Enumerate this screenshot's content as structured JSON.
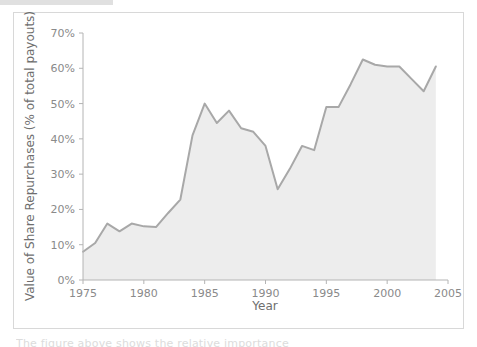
{
  "figure": {
    "background_color": "#ffffff",
    "frame_color": "#d8d8d8",
    "artifact_bar_color": "#e0e0e0",
    "bottom_caption_text": "The figure above shows the relative importance"
  },
  "chart_data": {
    "type": "area",
    "title": "",
    "xlabel": "Year",
    "ylabel": "Value of Share Repurchases (% of total payouts)",
    "xlim": [
      1975,
      2005
    ],
    "ylim": [
      0,
      70
    ],
    "xticks": [
      1975,
      1980,
      1985,
      1990,
      1995,
      2000,
      2005
    ],
    "xtick_labels": [
      "1975",
      "1980",
      "1985",
      "1990",
      "1995",
      "2000",
      "2005"
    ],
    "yticks": [
      0,
      10,
      20,
      30,
      40,
      50,
      60,
      70
    ],
    "ytick_labels": [
      "0%",
      "10%",
      "20%",
      "30%",
      "40%",
      "50%",
      "60%",
      "70%"
    ],
    "grid": false,
    "legend": null,
    "line_color": "#a8a8a8",
    "fill_color": "#ededed",
    "x": [
      1975,
      1976,
      1977,
      1978,
      1979,
      1980,
      1981,
      1982,
      1983,
      1984,
      1985,
      1986,
      1987,
      1988,
      1989,
      1990,
      1991,
      1992,
      1993,
      1994,
      1995,
      1996,
      1997,
      1998,
      1999,
      2000,
      2001,
      2002,
      2003,
      2004
    ],
    "values": [
      8.0,
      10.5,
      16.0,
      13.8,
      16.0,
      15.2,
      15.0,
      19.0,
      22.8,
      41.0,
      50.0,
      44.5,
      48.0,
      43.0,
      42.0,
      38.0,
      25.7,
      31.5,
      38.0,
      36.8,
      49.0,
      49.0,
      55.5,
      62.5,
      61.0,
      60.5,
      60.5,
      57.0,
      53.5,
      60.5
    ],
    "series": [
      {
        "name": "Value of Share Repurchases",
        "values": [
          8.0,
          10.5,
          16.0,
          13.8,
          16.0,
          15.2,
          15.0,
          19.0,
          22.8,
          41.0,
          50.0,
          44.5,
          48.0,
          43.0,
          42.0,
          38.0,
          25.7,
          31.5,
          38.0,
          36.8,
          49.0,
          49.0,
          55.5,
          62.5,
          61.0,
          60.5,
          60.5,
          57.0,
          53.5,
          60.5
        ]
      }
    ]
  }
}
